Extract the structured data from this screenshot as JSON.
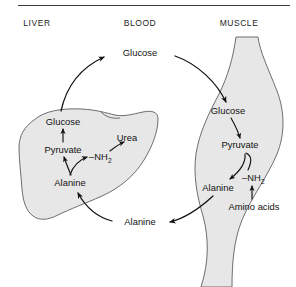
{
  "figure": {
    "compartments": [
      {
        "id": "liver",
        "label": "LIVER"
      },
      {
        "id": "blood",
        "label": "BLOOD"
      },
      {
        "id": "muscle",
        "label": "MUSCLE"
      }
    ],
    "colors": {
      "organ_fill": "#e7e7e7",
      "organ_stroke": "#5e5e5e",
      "arrow": "#111111",
      "text": "#121212",
      "rule": "#3b3b3b",
      "background": "#ffffff"
    },
    "divider_rule": true,
    "nodes": {
      "blood_glucose": "Glucose",
      "blood_alanine": "Alanine",
      "liver_glucose": "Glucose",
      "liver_pyruvate": "Pyruvate",
      "liver_alanine": "Alanine",
      "liver_amino_group": "–NH",
      "liver_amino_group_sub": "2",
      "liver_urea": "Urea",
      "muscle_glucose": "Glucose",
      "muscle_pyruvate": "Pyruvate",
      "muscle_alanine": "Alanine",
      "muscle_amino_group": "–NH",
      "muscle_amino_group_sub": "2",
      "muscle_amino_acids": "Amino acids"
    },
    "flows": [
      {
        "id": "liver-glucose-to-blood",
        "from": "Glucose (liver)",
        "to": "Glucose (blood)"
      },
      {
        "id": "blood-glucose-to-muscle",
        "from": "Glucose (blood)",
        "to": "Glucose (muscle)"
      },
      {
        "id": "muscle-glucose-to-pyruvate",
        "from": "Glucose (muscle)",
        "to": "Pyruvate (muscle)"
      },
      {
        "id": "muscle-pyruvate-to-alanine",
        "from": "Pyruvate (muscle)",
        "to": "Alanine (muscle)"
      },
      {
        "id": "muscle-aminoacids-to-nh2",
        "from": "Amino acids (muscle)",
        "to": "–NH2 (muscle)"
      },
      {
        "id": "muscle-alanine-to-blood",
        "from": "Alanine (muscle)",
        "to": "Alanine (blood)"
      },
      {
        "id": "blood-alanine-to-liver",
        "from": "Alanine (blood)",
        "to": "Alanine (liver)"
      },
      {
        "id": "liver-alanine-to-pyruvate",
        "from": "Alanine (liver)",
        "to": "Pyruvate (liver)"
      },
      {
        "id": "liver-alanine-to-nh2",
        "from": "Alanine (liver)",
        "to": "–NH2 (liver)"
      },
      {
        "id": "liver-nh2-to-urea",
        "from": "–NH2 (liver)",
        "to": "Urea (liver)"
      },
      {
        "id": "liver-pyruvate-to-glucose",
        "from": "Pyruvate (liver)",
        "to": "Glucose (liver)"
      }
    ]
  }
}
